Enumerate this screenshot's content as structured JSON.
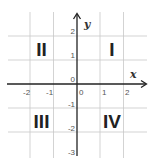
{
  "diagram": {
    "type": "coordinate-plane",
    "axes": {
      "x_label": "x",
      "y_label": "y",
      "x_ticks": [
        "-2",
        "-1",
        "0",
        "1",
        "2"
      ],
      "y_ticks": [
        "2",
        "1",
        "0",
        "-1",
        "-2",
        "-3"
      ],
      "x_range": [
        -3,
        3
      ],
      "y_range": [
        -3,
        3
      ]
    },
    "quadrants": [
      {
        "name": "I",
        "label": "I"
      },
      {
        "name": "II",
        "label": "II"
      },
      {
        "name": "III",
        "label": "III"
      },
      {
        "name": "IV",
        "label": "IV"
      }
    ],
    "colors": {
      "grid": "#c8c8c8",
      "axis": "#222222",
      "label": "#222222"
    }
  }
}
